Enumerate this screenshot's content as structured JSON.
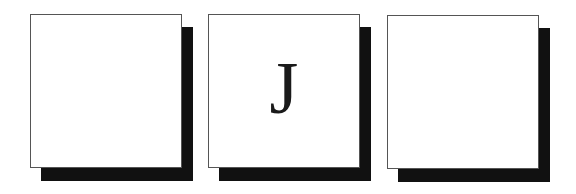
{
  "tiles": [
    {
      "letter": ""
    },
    {
      "letter": "J"
    },
    {
      "letter": ""
    }
  ]
}
